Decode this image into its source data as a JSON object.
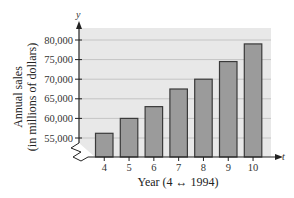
{
  "chart_data": {
    "type": "bar",
    "title": "",
    "categories": [
      "4",
      "5",
      "6",
      "7",
      "8",
      "9",
      "10"
    ],
    "values": [
      56200,
      60000,
      63000,
      67500,
      70000,
      74500,
      79000
    ],
    "xlabel": "Year (4 ↔ 1994)",
    "ylabel_line1": "Annual sales",
    "ylabel_line2": "(in millions of dollars)",
    "x_axis_var": "t",
    "y_axis_var": "y",
    "yticks": [
      55000,
      60000,
      65000,
      70000,
      75000,
      80000
    ],
    "ytick_labels": [
      "55,000",
      "60,000",
      "65,000",
      "70,000",
      "75,000",
      "80,000"
    ],
    "ylim": [
      52000,
      83000
    ],
    "axis_break": true,
    "grid": true,
    "legend": "none",
    "colors": {
      "bar_fill": "#9b9b9b",
      "bar_stroke": "#3a3a3a",
      "plot_bg": "#e8e8e8",
      "grid": "#c4c4c4"
    }
  }
}
